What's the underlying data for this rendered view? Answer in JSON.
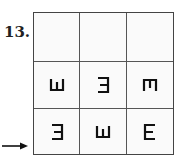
{
  "problem": {
    "number": "13."
  },
  "grid": {
    "rows": [
      [
        "",
        "",
        ""
      ],
      [
        "E-rotated-up",
        "E-mirrored",
        "E-rotated-down"
      ],
      [
        "E-mirrored",
        "E-rotated-up",
        "E-normal"
      ]
    ]
  },
  "arrow": {
    "icon": "right-arrow-icon",
    "points_to_row": 3
  },
  "colors": {
    "line": "#444444",
    "symbol": "#111111"
  }
}
